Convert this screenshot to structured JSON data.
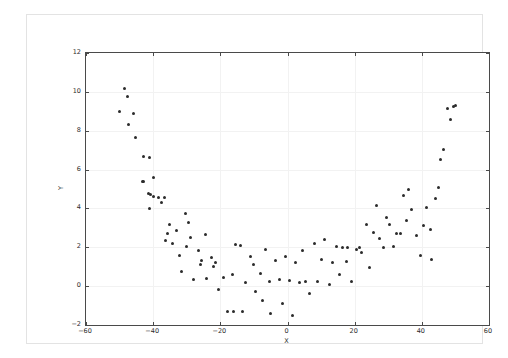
{
  "figure": {
    "background_color": "#ffffff",
    "frame_color": "#e3e3e3",
    "axes_color": "#4a4a4a",
    "grid_color": "#f2f2f2",
    "marker_color": "#2b2b2b"
  },
  "axes": {
    "xlabel": "X",
    "ylabel": "Y",
    "x_ticklabels": [
      "-60",
      "-40",
      "-20",
      "0",
      "20",
      "40",
      "60"
    ],
    "y_ticklabels": [
      "-2",
      "0",
      "2",
      "4",
      "6",
      "8",
      "10",
      "12"
    ]
  },
  "chart_data": {
    "type": "scatter",
    "title": "",
    "xlabel": "X",
    "ylabel": "Y",
    "xlim": [
      -60,
      60
    ],
    "ylim": [
      -2,
      12
    ],
    "xticks": [
      -60,
      -40,
      -20,
      0,
      20,
      40,
      60
    ],
    "yticks": [
      -2,
      0,
      2,
      4,
      6,
      8,
      10,
      12
    ],
    "grid": true,
    "legend": null,
    "marker": "point",
    "marker_color": "#2b2b2b",
    "series": [
      {
        "name": "points",
        "points": [
          [
            -48.5,
            10.15
          ],
          [
            -47.5,
            9.75
          ],
          [
            -50.0,
            9.0
          ],
          [
            -46.0,
            8.9
          ],
          [
            -47.2,
            8.3
          ],
          [
            -45.3,
            7.65
          ],
          [
            -43.0,
            6.65
          ],
          [
            -41.2,
            6.6
          ],
          [
            -40.0,
            5.6
          ],
          [
            -42.8,
            5.4
          ],
          [
            -43.2,
            5.4
          ],
          [
            -41.5,
            4.75
          ],
          [
            -40.8,
            4.7
          ],
          [
            -39.8,
            4.6
          ],
          [
            -41.0,
            4.0
          ],
          [
            -38.5,
            4.55
          ],
          [
            -37.5,
            4.3
          ],
          [
            -36.5,
            4.55
          ],
          [
            -35.0,
            3.15
          ],
          [
            -35.8,
            2.7
          ],
          [
            -36.3,
            2.35
          ],
          [
            -34.2,
            2.2
          ],
          [
            -33.2,
            2.85
          ],
          [
            -32.2,
            1.6
          ],
          [
            -31.5,
            0.75
          ],
          [
            -30.5,
            3.75
          ],
          [
            -29.5,
            3.3
          ],
          [
            -28.8,
            2.5
          ],
          [
            -30.0,
            2.05
          ],
          [
            -28.0,
            0.35
          ],
          [
            -26.5,
            1.85
          ],
          [
            -25.5,
            1.3
          ],
          [
            -26.0,
            1.1
          ],
          [
            -24.5,
            2.65
          ],
          [
            -24.0,
            0.4
          ],
          [
            -22.5,
            1.5
          ],
          [
            -21.5,
            1.2
          ],
          [
            -22.0,
            1.0
          ],
          [
            -20.5,
            -0.15
          ],
          [
            -19.0,
            0.45
          ],
          [
            -18.0,
            -1.3
          ],
          [
            -16.5,
            0.6
          ],
          [
            -16.0,
            -1.3
          ],
          [
            -15.5,
            2.15
          ],
          [
            -14.0,
            2.1
          ],
          [
            -13.5,
            -1.3
          ],
          [
            -12.5,
            0.2
          ],
          [
            -11.0,
            1.55
          ],
          [
            -10.0,
            1.1
          ],
          [
            -9.5,
            -0.25
          ],
          [
            -8.0,
            0.65
          ],
          [
            -7.5,
            -0.75
          ],
          [
            -6.5,
            1.9
          ],
          [
            -5.5,
            0.25
          ],
          [
            -5.0,
            -1.4
          ],
          [
            -3.5,
            1.3
          ],
          [
            -2.5,
            0.35
          ],
          [
            -1.5,
            -0.9
          ],
          [
            -0.5,
            1.55
          ],
          [
            0.5,
            0.3
          ],
          [
            1.5,
            -1.5
          ],
          [
            2.5,
            1.2
          ],
          [
            3.5,
            0.2
          ],
          [
            4.5,
            1.85
          ],
          [
            5.5,
            0.25
          ],
          [
            6.5,
            -0.4
          ],
          [
            8.0,
            2.2
          ],
          [
            9.0,
            0.25
          ],
          [
            10.0,
            1.35
          ],
          [
            11.0,
            2.4
          ],
          [
            12.5,
            0.1
          ],
          [
            13.5,
            1.2
          ],
          [
            14.5,
            2.05
          ],
          [
            15.5,
            0.6
          ],
          [
            16.5,
            2.0
          ],
          [
            17.5,
            1.25
          ],
          [
            18.0,
            2.0
          ],
          [
            19.0,
            0.25
          ],
          [
            20.5,
            1.9
          ],
          [
            21.5,
            2.0
          ],
          [
            22.0,
            1.75
          ],
          [
            23.5,
            3.15
          ],
          [
            24.5,
            0.95
          ],
          [
            25.5,
            2.75
          ],
          [
            26.5,
            4.15
          ],
          [
            27.5,
            2.45
          ],
          [
            28.5,
            2.0
          ],
          [
            29.5,
            3.55
          ],
          [
            30.5,
            3.15
          ],
          [
            31.5,
            2.05
          ],
          [
            32.5,
            2.7
          ],
          [
            33.5,
            2.7
          ],
          [
            34.5,
            4.65
          ],
          [
            35.5,
            3.4
          ],
          [
            36.0,
            5.0
          ],
          [
            37.0,
            3.95
          ],
          [
            38.5,
            2.6
          ],
          [
            39.5,
            1.6
          ],
          [
            40.5,
            3.1
          ],
          [
            41.5,
            4.05
          ],
          [
            42.5,
            2.9
          ],
          [
            43.0,
            1.35
          ],
          [
            44.0,
            4.5
          ],
          [
            45.0,
            5.1
          ],
          [
            45.5,
            6.5
          ],
          [
            46.5,
            7.05
          ],
          [
            47.5,
            9.15
          ],
          [
            48.5,
            8.6
          ],
          [
            49.5,
            9.25
          ],
          [
            50.0,
            9.3
          ]
        ]
      }
    ]
  }
}
